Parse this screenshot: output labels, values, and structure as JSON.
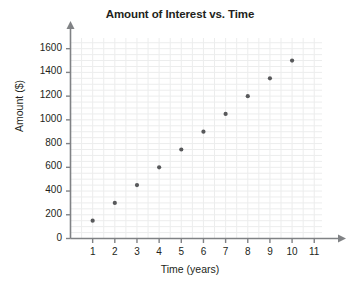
{
  "chart_data": {
    "type": "scatter",
    "title": "Amount of Interest vs. Time",
    "xlabel": "Time (years)",
    "ylabel": "Amount ($)",
    "x": [
      1,
      2,
      3,
      4,
      5,
      6,
      7,
      8,
      9,
      10
    ],
    "values": [
      150,
      300,
      450,
      600,
      750,
      900,
      1050,
      1200,
      1350,
      1500
    ],
    "points": [
      {
        "x": 1,
        "y": 150
      },
      {
        "x": 2,
        "y": 300
      },
      {
        "x": 3,
        "y": 450
      },
      {
        "x": 4,
        "y": 600
      },
      {
        "x": 5,
        "y": 750
      },
      {
        "x": 6,
        "y": 900
      },
      {
        "x": 7,
        "y": 1050
      },
      {
        "x": 8,
        "y": 1200
      },
      {
        "x": 9,
        "y": 1350
      },
      {
        "x": 10,
        "y": 1500
      }
    ],
    "xlim": [
      0,
      11.35
    ],
    "ylim": [
      0,
      1690
    ],
    "xticks": [
      1,
      2,
      3,
      4,
      5,
      6,
      7,
      8,
      9,
      10,
      11
    ],
    "xtick_labels": [
      "1",
      "2",
      "3",
      "4",
      "5",
      "6",
      "7",
      "8",
      "9",
      "10",
      "11"
    ],
    "yticks": [
      0,
      200,
      400,
      600,
      800,
      1000,
      1200,
      1400,
      1600
    ],
    "ytick_labels": [
      "0",
      "200",
      "400",
      "600",
      "800",
      "1000",
      "1200",
      "1400",
      "1600"
    ],
    "grid": true,
    "grid_minor_x_step": 0.5,
    "grid_minor_y_step": 50,
    "legend": null,
    "marker_color": "#58595b",
    "grid_color": "#eceded",
    "axis_color": "#808285",
    "text_color": "#231f20",
    "background_color": "#ffffff"
  }
}
